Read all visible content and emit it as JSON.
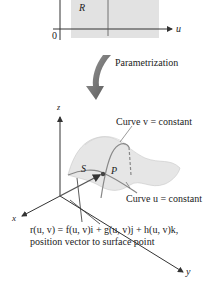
{
  "figure": {
    "domain_plane": {
      "region_label": "R",
      "origin_label": "0",
      "u_axis_label": "u",
      "region_color": "#e2e2e2"
    },
    "transition": {
      "label": "Parametrization",
      "arrow_color": "#7a7a7a"
    },
    "surface_plot": {
      "axes": {
        "x": "x",
        "y": "y",
        "z": "z"
      },
      "surface_label": "S",
      "point_label": "P",
      "curve_v_label": "Curve v = constant",
      "curve_u_label": "Curve u = constant",
      "surface_color": "#e6e6e6",
      "curve_color": "#888888"
    },
    "equation": {
      "line1": "r(u, v) = f(u, v)i + g(u, v)j + h(u, v)k,",
      "line2": "position vector to surface point"
    }
  }
}
